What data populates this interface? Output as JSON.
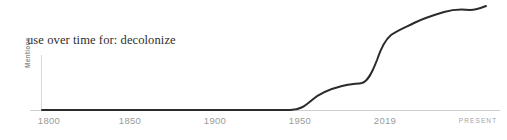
{
  "widget": {
    "name": "use-over-time-sparkline",
    "background": "#ffffff"
  },
  "title": "use over time for: decolonize",
  "term": "decolonize",
  "axes": {
    "y_label": "Mentions",
    "x_ticks": [
      {
        "label": "1800",
        "x": 49,
        "year": 1800
      },
      {
        "label": "1850",
        "x": 130,
        "year": 1850
      },
      {
        "label": "1900",
        "x": 215,
        "year": 1900
      },
      {
        "label": "1950",
        "x": 300,
        "year": 1950
      },
      {
        "label": "2019",
        "x": 385,
        "year": 2019
      },
      {
        "label": "PRESENT",
        "x": 478,
        "year": 2024
      }
    ],
    "axis_color": "#cccccc",
    "tick_label_color": "#9a9a9a",
    "baseline_y": 110,
    "y_axis_x": 41,
    "y_axis_top": 55
  },
  "line": {
    "color": "#2b2b2b",
    "width": 2,
    "path": "M 42,110 L 120,110 L 200,110 L 260,110 L 290,110 C 300,110 305,106 312,100 C 320,93 330,89 342,86 C 350,84 356,84 362,83 C 368,81 372,73 377,60 C 381,48 385,40 391,35 C 398,30 406,27 414,23 C 424,18 434,15 444,12 C 454,9 462,9 470,10 C 476,10 481,8 486,6"
  },
  "chart_data": {
    "type": "line",
    "title": "use over time for: decolonize",
    "xlabel": "",
    "ylabel": "Mentions",
    "xlim": [
      1800,
      2024
    ],
    "ylim": [
      0,
      100
    ],
    "grid": false,
    "legend": null,
    "x_tick_labels": [
      "1800",
      "1850",
      "1900",
      "1950",
      "2019",
      "PRESENT"
    ],
    "x_tick_values": [
      1800,
      1850,
      1900,
      1950,
      2019,
      2024
    ],
    "series": [
      {
        "name": "decolonize",
        "x": [
          1800,
          1820,
          1840,
          1860,
          1880,
          1900,
          1920,
          1940,
          1947,
          1955,
          1960,
          1965,
          1970,
          1975,
          1980,
          1985,
          1990,
          1995,
          2000,
          2005,
          2010,
          2015,
          2019,
          2022,
          2024
        ],
        "values": [
          0,
          0,
          0,
          0,
          0,
          0,
          0,
          0,
          0,
          6,
          11,
          16,
          20,
          22,
          23,
          25,
          39,
          52,
          60,
          67,
          74,
          80,
          84,
          88,
          95
        ]
      }
    ]
  }
}
